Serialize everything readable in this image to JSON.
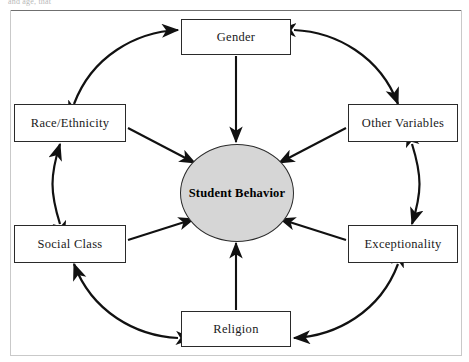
{
  "page": {
    "header_text": "and age, that",
    "background_color": "#ffffff"
  },
  "diagram": {
    "type": "hub-and-spoke",
    "title": "",
    "hub": {
      "label": "Student Behavior",
      "shape": "ellipse",
      "fill_color": "#d6d6d6",
      "stroke_color": "#2b2b2b"
    },
    "nodes": [
      {
        "id": "gender",
        "label": "Gender",
        "position": "top"
      },
      {
        "id": "other",
        "label": "Other Variables",
        "position": "right-top"
      },
      {
        "id": "exceptionality",
        "label": "Exceptionality",
        "position": "right-bottom"
      },
      {
        "id": "religion",
        "label": "Religion",
        "position": "bottom"
      },
      {
        "id": "social",
        "label": "Social Class",
        "position": "left-bottom"
      },
      {
        "id": "race",
        "label": "Race/Ethnicity",
        "position": "left-top"
      }
    ],
    "spoke_arrows": [
      {
        "from": "gender",
        "to": "hub",
        "heads": 1
      },
      {
        "from": "other",
        "to": "hub",
        "heads": 1
      },
      {
        "from": "exceptionality",
        "to": "hub",
        "heads": 1
      },
      {
        "from": "religion",
        "to": "hub",
        "heads": 1
      },
      {
        "from": "social",
        "to": "hub",
        "heads": 1
      },
      {
        "from": "race",
        "to": "hub",
        "heads": 1
      }
    ],
    "ring_arrows": [
      {
        "between": [
          "race",
          "gender"
        ],
        "heads": 2,
        "style": "curved"
      },
      {
        "between": [
          "gender",
          "other"
        ],
        "heads": 2,
        "style": "curved"
      },
      {
        "between": [
          "other",
          "exceptionality"
        ],
        "heads": 2,
        "style": "curved"
      },
      {
        "between": [
          "exceptionality",
          "religion"
        ],
        "heads": 2,
        "style": "curved"
      },
      {
        "between": [
          "religion",
          "social"
        ],
        "heads": 2,
        "style": "curved"
      },
      {
        "between": [
          "social",
          "race"
        ],
        "heads": 2,
        "style": "curved"
      }
    ]
  }
}
